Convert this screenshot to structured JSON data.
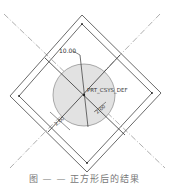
{
  "diagram": {
    "type": "cad-sketch",
    "dimension_label": "10.00",
    "csys_label": "PRT_CSYS_DEF",
    "small_dim_left": "2.00",
    "small_dim_right": "2.00",
    "colors": {
      "line": "#333333",
      "centerline": "#666666",
      "circle_fill": "#e2e2e2",
      "circle_stroke": "#888888"
    }
  },
  "caption": "图 — — 正方形后的结果"
}
